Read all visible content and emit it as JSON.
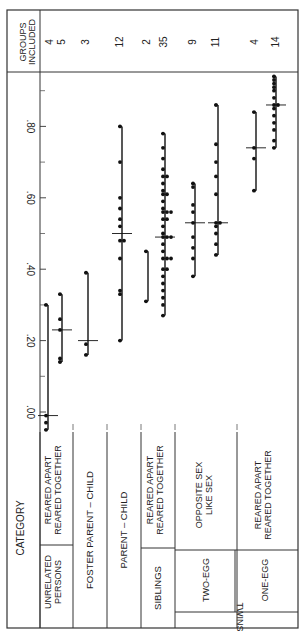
{
  "chart_data": {
    "type": "scatter",
    "orientation": "rotated-90-ccw",
    "title": "",
    "xlabel": "Correlation coefficient",
    "ylabel": "CATEGORY",
    "value_axis": {
      "ticks": [
        ".00",
        ".20",
        ".40",
        ".60",
        ".80"
      ],
      "tick_values": [
        0.0,
        0.2,
        0.4,
        0.6,
        0.8
      ],
      "minor_tick_values": [
        0.1,
        0.3,
        0.5,
        0.7,
        0.9
      ],
      "range": [
        -0.06,
        0.96
      ]
    },
    "header": {
      "category_label": "CATEGORY",
      "groups_label_line1": "GROUPS",
      "groups_label_line2": "INCLUDED",
      "twins_label": "TWINS"
    },
    "groups": [
      {
        "group": "UNRELATED PERSONS",
        "labels": [
          "UNRELATED",
          "PERSONS"
        ]
      },
      {
        "group": "FOSTER PARENT – CHILD",
        "labels": [
          "FOSTER PARENT – CHILD"
        ]
      },
      {
        "group": "PARENT – CHILD",
        "labels": [
          "PARENT – CHILD"
        ]
      },
      {
        "group": "SIBLINGS",
        "labels": [
          "SIBLINGS"
        ]
      },
      {
        "group": "TWO-EGG",
        "labels": [
          "TWO-EGG"
        ],
        "parent": "TWINS"
      },
      {
        "group": "ONE-EGG",
        "labels": [
          "ONE-EGG"
        ],
        "parent": "TWINS"
      }
    ],
    "series": [
      {
        "name": "Unrelated persons – reared apart",
        "sub_label": "REARED APART",
        "groups_included": "4",
        "values": [
          0.3,
          -0.01,
          -0.03,
          -0.05
        ],
        "median": -0.01
      },
      {
        "name": "Unrelated persons – reared together",
        "sub_label": "REARED TOGETHER",
        "groups_included": "5",
        "values": [
          0.33,
          0.26,
          0.23,
          0.15,
          0.14
        ],
        "median": 0.23
      },
      {
        "name": "Foster parent – child",
        "sub_label": "",
        "groups_included": "3",
        "values": [
          0.39,
          0.19,
          0.16
        ],
        "median": 0.2
      },
      {
        "name": "Parent – child",
        "sub_label": "",
        "groups_included": "12",
        "values": [
          0.8,
          0.7,
          0.6,
          0.57,
          0.54,
          0.52,
          0.48,
          0.48,
          0.43,
          0.34,
          0.33,
          0.2
        ],
        "median": 0.5
      },
      {
        "name": "Siblings – reared apart",
        "sub_label": "REARED APART",
        "groups_included": "2",
        "values": [
          0.45,
          0.31
        ],
        "median": null
      },
      {
        "name": "Siblings – reared together",
        "sub_label": "REARED TOGETHER",
        "groups_included": "35",
        "values": [
          0.78,
          0.74,
          0.71,
          0.68,
          0.66,
          0.66,
          0.64,
          0.62,
          0.61,
          0.61,
          0.59,
          0.57,
          0.56,
          0.56,
          0.56,
          0.54,
          0.54,
          0.52,
          0.5,
          0.49,
          0.49,
          0.49,
          0.47,
          0.45,
          0.43,
          0.43,
          0.43,
          0.4,
          0.4,
          0.38,
          0.36,
          0.34,
          0.32,
          0.3,
          0.27
        ],
        "median": 0.49
      },
      {
        "name": "Two-egg twins – opposite sex",
        "sub_label": "OPPOSITE SEX",
        "groups_included": "9",
        "values": [
          0.64,
          0.63,
          0.58,
          0.56,
          0.53,
          0.49,
          0.46,
          0.43,
          0.38
        ],
        "median": 0.53
      },
      {
        "name": "Two-egg twins – like sex",
        "sub_label": "LIKE SEX",
        "groups_included": "11",
        "values": [
          0.86,
          0.75,
          0.7,
          0.66,
          0.61,
          0.53,
          0.53,
          0.52,
          0.5,
          0.47,
          0.44
        ],
        "median": 0.53
      },
      {
        "name": "One-egg twins – reared apart",
        "sub_label": "REARED APART",
        "groups_included": "4",
        "values": [
          0.84,
          0.74,
          0.71,
          0.62
        ],
        "median": 0.74
      },
      {
        "name": "One-egg twins – reared together",
        "sub_label": "REARED TOGETHER",
        "groups_included": "14",
        "values": [
          0.94,
          0.93,
          0.92,
          0.91,
          0.9,
          0.88,
          0.86,
          0.86,
          0.85,
          0.83,
          0.81,
          0.79,
          0.76,
          0.74
        ],
        "median": 0.86
      }
    ],
    "grid": false,
    "legend": "none"
  }
}
